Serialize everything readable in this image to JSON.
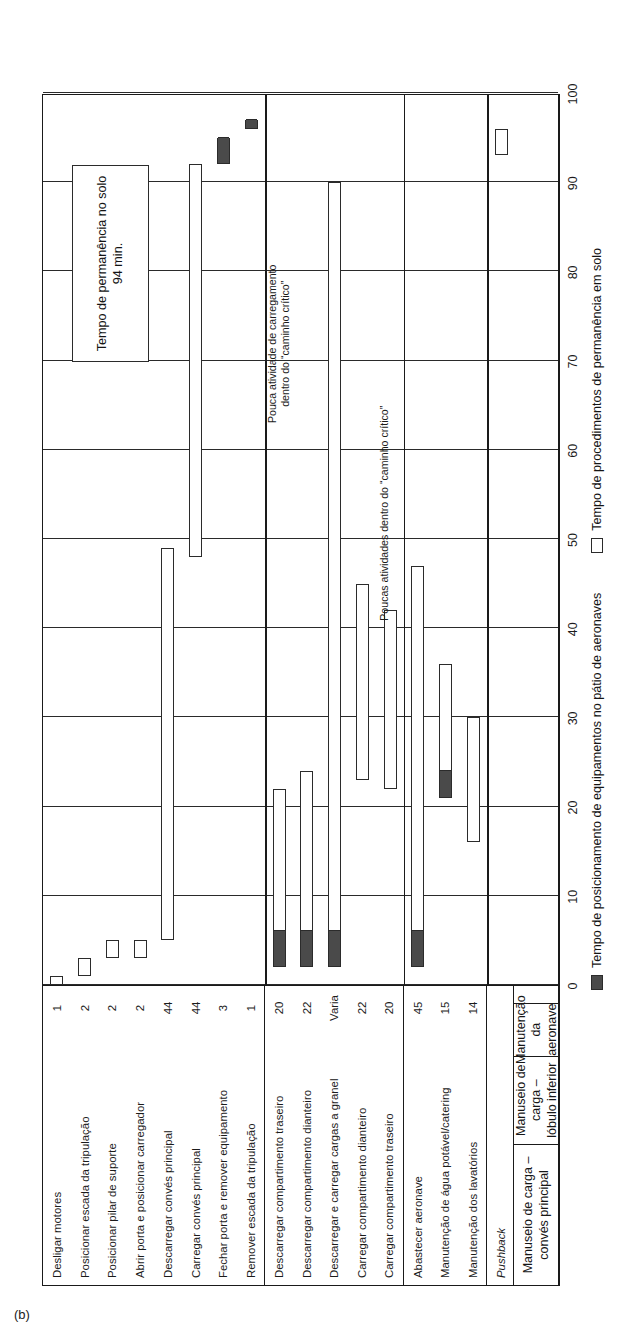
{
  "figure": {
    "label": "(b)"
  },
  "callout": {
    "text": "Tempo de permanência no solo 94 min."
  },
  "annotations": [
    {
      "text": "Pouca atividade de carregamento\ndentro do “caminho crítico”"
    },
    {
      "text": "Poucas atividades dentro do “caminho crítico”"
    }
  ],
  "axis": {
    "ticks": [
      0,
      10,
      20,
      30,
      40,
      50,
      60,
      70,
      80,
      90,
      100
    ],
    "min": 0,
    "max": 100
  },
  "legend": {
    "items": [
      {
        "swatch": "dark",
        "label": "Tempo de posicionamento de equipamentos no pátio de aeronaves"
      },
      {
        "swatch": "light",
        "label": "Tempo de procedimentos de permanência em solo"
      }
    ]
  },
  "groups": [
    {
      "name": "Manuseio de carga – convés principal",
      "rows": 8
    },
    {
      "name": "Manuseio de carga – lóbulo inferior",
      "rows": 5
    },
    {
      "name": "Manutenção da aeronave",
      "rows": 3
    },
    {
      "name": "",
      "rows": 1
    }
  ],
  "chart_data": {
    "type": "bar",
    "title": "Tempo de permanência no solo 94 min.",
    "xlabel": "",
    "ylabel": "",
    "xlim": [
      0,
      100
    ],
    "grid": true,
    "legend_position": "bottom",
    "columns": [
      "Tarefa",
      "Duração (min)",
      "Início (min)",
      "Fim (min)",
      "Setup escuro (min)"
    ],
    "tasks": [
      {
        "name": "Desligar motores",
        "duration": "1",
        "start": 0,
        "end": 1,
        "setup": 0,
        "group": 0
      },
      {
        "name": "Posicionar escada da tripulação",
        "duration": "2",
        "start": 1,
        "end": 3,
        "setup": 0,
        "group": 0
      },
      {
        "name": "Posicionar pilar de suporte",
        "duration": "2",
        "start": 3,
        "end": 5,
        "setup": 0,
        "group": 0
      },
      {
        "name": "Abrir porta e posicionar carregador",
        "duration": "2",
        "start": 3,
        "end": 5,
        "setup": 0,
        "group": 0
      },
      {
        "name": "Descarregar convés principal",
        "duration": "44",
        "start": 5,
        "end": 49,
        "setup": 0,
        "group": 0
      },
      {
        "name": "Carregar convés principal",
        "duration": "44",
        "start": 48,
        "end": 92,
        "setup": 0,
        "group": 0
      },
      {
        "name": "Fechar porta e remover equipamento",
        "duration": "3",
        "start": 92,
        "end": 95,
        "setup": 3,
        "group": 0
      },
      {
        "name": "Remover escada da tripulação",
        "duration": "1",
        "start": 96,
        "end": 97,
        "setup": 1,
        "group": 0
      },
      {
        "name": "Descarregar compartimento traseiro",
        "duration": "20",
        "start": 2,
        "end": 22,
        "setup": 4,
        "group": 1
      },
      {
        "name": "Descarregar compartimento dianteiro",
        "duration": "22",
        "start": 2,
        "end": 24,
        "setup": 4,
        "group": 1
      },
      {
        "name": "Descarregar e carregar cargas a granel",
        "duration": "Varia",
        "start": 2,
        "end": 90,
        "setup": 4,
        "group": 1
      },
      {
        "name": "Carregar compartimento dianteiro",
        "duration": "22",
        "start": 23,
        "end": 45,
        "setup": 0,
        "group": 1
      },
      {
        "name": "Carregar compartimento traseiro",
        "duration": "20",
        "start": 22,
        "end": 42,
        "setup": 0,
        "group": 1
      },
      {
        "name": "Abastecer aeronave",
        "duration": "45",
        "start": 2,
        "end": 47,
        "setup": 4,
        "group": 2
      },
      {
        "name": "Manutenção de água potável/catering",
        "duration": "15",
        "start": 21,
        "end": 36,
        "setup": 3,
        "group": 2
      },
      {
        "name": "Manutenção dos lavatórios",
        "duration": "14",
        "start": 16,
        "end": 30,
        "setup": 0,
        "group": 2
      },
      {
        "name": "Pushback",
        "duration": "",
        "start": 93,
        "end": 96,
        "setup": 0,
        "group": 3,
        "italic": true
      }
    ]
  }
}
